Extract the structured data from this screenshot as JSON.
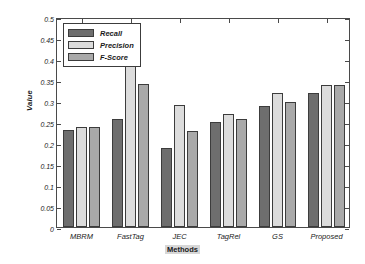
{
  "chart_data": {
    "type": "bar",
    "title": "",
    "xlabel": "Methods",
    "ylabel": "Value",
    "categories": [
      "MBRM",
      "FastTag",
      "JEC",
      "TagRel",
      "GS",
      "Proposed"
    ],
    "series": [
      {
        "name": "Recall",
        "color": "#6e6e6e",
        "values": [
          0.23,
          0.258,
          0.188,
          0.249,
          0.289,
          0.32
        ]
      },
      {
        "name": "Precision",
        "color": "#dcdcdc",
        "values": [
          0.239,
          0.471,
          0.29,
          0.268,
          0.319,
          0.338
        ]
      },
      {
        "name": "F-Score",
        "color": "#a9a9a9",
        "values": [
          0.239,
          0.34,
          0.229,
          0.258,
          0.298,
          0.338
        ]
      }
    ],
    "ylim": [
      0,
      0.5
    ],
    "yticks": [
      0,
      0.05,
      0.1,
      0.15,
      0.2,
      0.25,
      0.3,
      0.35,
      0.4,
      0.45,
      0.5
    ],
    "ytick_labels": [
      "0",
      "0.05",
      "0.1",
      "0.15",
      "0.2",
      "0.25",
      "0.3",
      "0.35",
      "0.4",
      "0.45",
      "0.5"
    ],
    "grid": false,
    "legend_position": "top-left",
    "legend": [
      "Recall",
      "Precision",
      "F-Score"
    ]
  },
  "axes": {
    "ylabel": "Value",
    "xlabel": "Methods"
  },
  "legend": {
    "items": [
      {
        "label": "Recall"
      },
      {
        "label": "Precision"
      },
      {
        "label": "F-Score"
      }
    ]
  }
}
